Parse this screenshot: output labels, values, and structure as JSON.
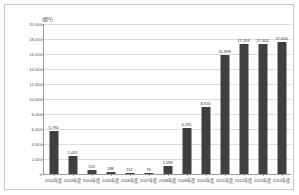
{
  "chart_data": {
    "type": "bar",
    "title": "",
    "subtitle": "",
    "unit_label": "(億円)",
    "xlabel": "",
    "ylabel": "",
    "ylim": [
      0,
      20000
    ],
    "ytick_step": 2000,
    "ytick_labels": [
      "20,000",
      "18,000",
      "16,000",
      "14,000",
      "12,000",
      "10,000",
      "8,000",
      "6,000",
      "4,000",
      "2,000",
      "0"
    ],
    "grid": true,
    "legend": "none",
    "bar_color": "#3f3f3f",
    "categories": [
      "2002年度",
      "2003年度",
      "2004年度",
      "2005年度",
      "2006年度",
      "2007年度",
      "2008年度",
      "2009年度",
      "2010年度",
      "2011年度",
      "2012年度",
      "2013年度",
      "2014年度"
    ],
    "values": [
      5790,
      2443,
      513,
      288,
      112,
      76,
      1098,
      6185,
      8920,
      15898,
      17293,
      17302,
      17634
    ],
    "value_labels": [
      "5,790",
      "2,443",
      "513",
      "288",
      "112",
      "76",
      "1,098",
      "6,185",
      "8,920",
      "15,898",
      "17,293",
      "17,302",
      "17,634"
    ]
  }
}
